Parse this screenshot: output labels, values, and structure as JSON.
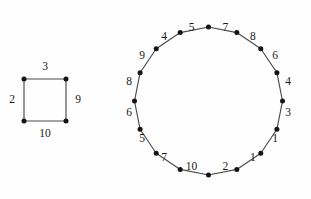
{
  "figure": {
    "background_color": "#fefefe",
    "edge_color": "#4a4a4a",
    "vertex_color": "#141414",
    "label_color": "#1a1a1a"
  },
  "graphs": [
    {
      "name": "square-graph",
      "shape": "square",
      "vertex_count": 4,
      "geometry": {
        "left": 24,
        "top": 79,
        "right": 66,
        "bottom": 121
      },
      "vertices": [
        {
          "id": "sq-v0",
          "cx": 24,
          "cy": 79
        },
        {
          "id": "sq-v1",
          "cx": 66,
          "cy": 79
        },
        {
          "id": "sq-v2",
          "cx": 66,
          "cy": 121
        },
        {
          "id": "sq-v3",
          "cx": 24,
          "cy": 121
        }
      ],
      "edges": [
        {
          "id": "sq-e-top",
          "position": "top",
          "label": "3",
          "lx": 45,
          "ly": 67
        },
        {
          "id": "sq-e-right",
          "position": "right",
          "label": "9",
          "lx": 78,
          "ly": 100
        },
        {
          "id": "sq-e-bottom",
          "position": "bottom",
          "label": "10",
          "lx": 45,
          "ly": 134
        },
        {
          "id": "sq-e-left",
          "position": "left",
          "label": "2",
          "lx": 12,
          "ly": 100
        }
      ],
      "edge_labels_clockwise_from_top": [
        "3",
        "9",
        "10",
        "2"
      ]
    },
    {
      "name": "cycle-16-graph",
      "shape": "regular-16-gon",
      "vertex_count": 16,
      "geometry": {
        "center_x": 208.5,
        "center_y": 101,
        "radius": 74,
        "label_radius": 89,
        "start_angle_deg": -90
      },
      "vertices": [
        {
          "id": "c-v0",
          "cx": 208.5,
          "cy": 27.0
        },
        {
          "id": "c-v1",
          "cx": 236.8,
          "cy": 32.6
        },
        {
          "id": "c-v2",
          "cx": 260.8,
          "cy": 48.7
        },
        {
          "id": "c-v3",
          "cx": 276.9,
          "cy": 72.7
        },
        {
          "id": "c-v4",
          "cx": 282.5,
          "cy": 101.0
        },
        {
          "id": "c-v5",
          "cx": 276.9,
          "cy": 129.3
        },
        {
          "id": "c-v6",
          "cx": 260.8,
          "cy": 153.3
        },
        {
          "id": "c-v7",
          "cx": 236.8,
          "cy": 169.4
        },
        {
          "id": "c-v8",
          "cx": 208.5,
          "cy": 175.0
        },
        {
          "id": "c-v9",
          "cx": 180.2,
          "cy": 169.4
        },
        {
          "id": "c-v10",
          "cx": 156.2,
          "cy": 153.3
        },
        {
          "id": "c-v11",
          "cx": 140.1,
          "cy": 129.3
        },
        {
          "id": "c-v12",
          "cx": 134.5,
          "cy": 101.0
        },
        {
          "id": "c-v13",
          "cx": 140.1,
          "cy": 72.7
        },
        {
          "id": "c-v14",
          "cx": 156.2,
          "cy": 48.7
        },
        {
          "id": "c-v15",
          "cx": 180.2,
          "cy": 32.6
        }
      ],
      "edges": [
        {
          "id": "c-e0",
          "from": "c-v0",
          "to": "c-v1",
          "label": "7",
          "lx": 225.4,
          "ly": 28.2
        },
        {
          "id": "c-e1",
          "from": "c-v1",
          "to": "c-v2",
          "label": "8",
          "lx": 252.9,
          "ly": 37.5
        },
        {
          "id": "c-e2",
          "from": "c-v2",
          "to": "c-v3",
          "label": "6",
          "lx": 275.0,
          "ly": 56.5
        },
        {
          "id": "c-e3",
          "from": "c-v3",
          "to": "c-v4",
          "label": "4",
          "lx": 288.0,
          "ly": 82.4
        },
        {
          "id": "c-e4",
          "from": "c-v4",
          "to": "c-v5",
          "label": "3",
          "lx": 288.0,
          "ly": 113.2
        },
        {
          "id": "c-e5",
          "from": "c-v5",
          "to": "c-v6",
          "label": "1",
          "lx": 275.0,
          "ly": 139.1
        },
        {
          "id": "c-e6",
          "from": "c-v6",
          "to": "c-v7",
          "label": "1",
          "lx": 252.9,
          "ly": 158.1
        },
        {
          "id": "c-e7",
          "from": "c-v7",
          "to": "c-v8",
          "label": "2",
          "lx": 225.4,
          "ly": 167.4
        },
        {
          "id": "c-e8",
          "from": "c-v8",
          "to": "c-v9",
          "label": "10",
          "lx": 191.6,
          "ly": 167.4
        },
        {
          "id": "c-e9",
          "from": "c-v9",
          "to": "c-v10",
          "label": "7",
          "lx": 164.1,
          "ly": 158.1
        },
        {
          "id": "c-e10",
          "from": "c-v10",
          "to": "c-v11",
          "label": "5",
          "lx": 142.0,
          "ly": 139.1
        },
        {
          "id": "c-e11",
          "from": "c-v11",
          "to": "c-v12",
          "label": "6",
          "lx": 129.0,
          "ly": 113.2
        },
        {
          "id": "c-e12",
          "from": "c-v12",
          "to": "c-v13",
          "label": "8",
          "lx": 129.0,
          "ly": 82.4
        },
        {
          "id": "c-e13",
          "from": "c-v13",
          "to": "c-v14",
          "label": "9",
          "lx": 142.0,
          "ly": 56.5
        },
        {
          "id": "c-e14",
          "from": "c-v14",
          "to": "c-v15",
          "label": "4",
          "lx": 164.1,
          "ly": 37.5
        },
        {
          "id": "c-e15",
          "from": "c-v15",
          "to": "c-v0",
          "label": "5",
          "lx": 191.6,
          "ly": 28.2
        }
      ],
      "edge_labels_clockwise_from_top": [
        "7",
        "8",
        "6",
        "4",
        "3",
        "1",
        "1",
        "2",
        "10",
        "7",
        "5",
        "6",
        "8",
        "9",
        "4",
        "5"
      ]
    }
  ]
}
